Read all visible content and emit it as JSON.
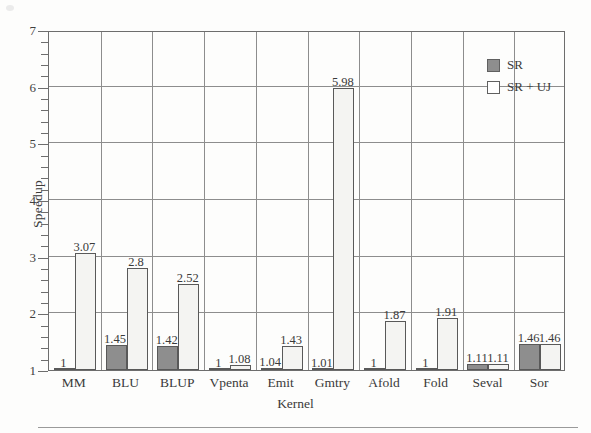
{
  "chart_data": {
    "type": "bar",
    "title": "",
    "xlabel": "Kernel",
    "ylabel": "Speedup",
    "categories": [
      "MM",
      "BLU",
      "BLUP",
      "Vpenta",
      "Emit",
      "Gmtry",
      "Afold",
      "Fold",
      "Seval",
      "Sor"
    ],
    "series": [
      {
        "name": "SR",
        "color": "#8e8e8e",
        "values": [
          1,
          1.45,
          1.42,
          1,
          1.04,
          1.01,
          1,
          1,
          1.11,
          1.46
        ],
        "labels": [
          "1",
          "1.45",
          "1.42",
          "1",
          "1.04",
          "1.01",
          "1",
          "1",
          "1.11",
          "1.46"
        ]
      },
      {
        "name": "SR + UJ",
        "color": "#f4f4f2",
        "values": [
          3.07,
          2.8,
          2.52,
          1.08,
          1.43,
          5.98,
          1.87,
          1.91,
          1.11,
          1.46
        ],
        "labels": [
          "3.07",
          "2.8",
          "2.52",
          "1.08",
          "1.43",
          "5.98",
          "1.87",
          "1.91",
          "1.11",
          "1.46"
        ]
      }
    ],
    "ylim": [
      1,
      7
    ],
    "yticks": [
      1,
      2,
      3,
      4,
      5,
      6,
      7
    ],
    "ytick_labels": [
      "1",
      "2",
      "3",
      "4",
      "5",
      "6",
      "7"
    ],
    "y_minor_ticks_per_interval": 5,
    "grid": "both",
    "legend_position": "top-right",
    "legend_entries": [
      "SR",
      "SR + UJ"
    ]
  },
  "axis": {
    "y_title": "Speedup",
    "x_title": "Kernel"
  },
  "legend": {
    "items": [
      {
        "label": "SR",
        "swatch": "filled-gray-square"
      },
      {
        "label": "SR + UJ",
        "swatch": "empty-white-square"
      }
    ]
  },
  "colors": {
    "sr_fill": "#8e8e8e",
    "sruj_fill": "#f4f4f2",
    "bar_stroke": "#595959",
    "grid": "#8d8d8d",
    "frame": "#6d6d6d",
    "text": "#3a3a3a"
  }
}
